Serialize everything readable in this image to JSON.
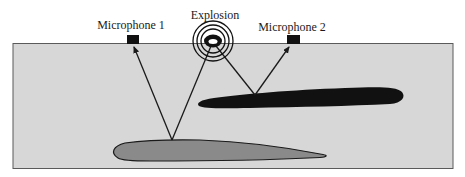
{
  "figure": {
    "labels": {
      "microphone_1": "Microphone 1",
      "explosion": "Explosion",
      "microphone_2": "Microphone 2"
    },
    "colors": {
      "background": "#ffffff",
      "ground_fill": "#d7d7d7",
      "ground_border": "#5a5a5a",
      "shallow_reflector_fill": "#111111",
      "deep_reflector_fill": "#8a8a8a",
      "deep_reflector_border": "#1a1a1a",
      "ray_color": "#1a1a1a",
      "microphone_fill": "#111111"
    },
    "elements": [
      {
        "id": "microphone-1",
        "type": "receiver",
        "shape": "square"
      },
      {
        "id": "explosion",
        "type": "source",
        "shape": "concentric-circles"
      },
      {
        "id": "microphone-2",
        "type": "receiver",
        "shape": "square"
      },
      {
        "id": "shallow-reflector",
        "type": "subsurface-layer",
        "color": "black"
      },
      {
        "id": "deep-reflector",
        "type": "subsurface-layer",
        "color": "gray"
      }
    ],
    "rays": [
      {
        "from": "explosion",
        "reflect_at": "deep-reflector",
        "to": "microphone-1"
      },
      {
        "from": "explosion",
        "reflect_at": "shallow-reflector",
        "to": "microphone-2"
      }
    ]
  }
}
